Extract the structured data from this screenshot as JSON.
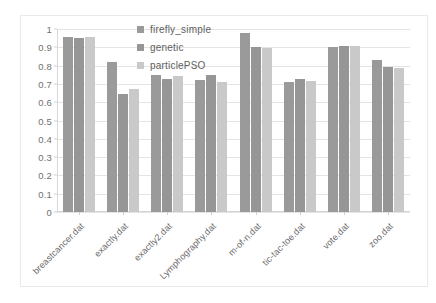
{
  "chart_data": {
    "type": "bar",
    "title": "",
    "subtitle": "",
    "xlabel": "",
    "ylabel": "",
    "ylim": [
      0,
      1
    ],
    "yticks": [
      "0",
      "0.1",
      "0.2",
      "0.3",
      "0.4",
      "0.5",
      "0.6",
      "0.7",
      "0.8",
      "0.9",
      "1"
    ],
    "grid": true,
    "legend_position": "top-center-inside",
    "categories": [
      "breastcancer.dat",
      "exactly.dat",
      "exactly2.dat",
      "Lymphography.dat",
      "m-of-n.dat",
      "tic-tac-toe.dat",
      "vote.dat",
      "zoo.dat"
    ],
    "series": [
      {
        "name": "firefly_simple",
        "color": "#9a9a9a",
        "values": [
          0.957,
          0.82,
          0.748,
          0.722,
          0.978,
          0.708,
          0.903,
          0.833
        ]
      },
      {
        "name": "genetic",
        "color": "#969696",
        "values": [
          0.953,
          0.645,
          0.726,
          0.748,
          0.9,
          0.727,
          0.905,
          0.79
        ]
      },
      {
        "name": "particlePSO",
        "color": "#c9c9c9",
        "values": [
          0.954,
          0.67,
          0.742,
          0.713,
          0.898,
          0.717,
          0.906,
          0.787
        ]
      }
    ]
  }
}
